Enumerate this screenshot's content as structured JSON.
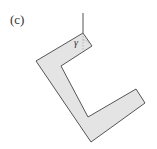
{
  "figure": {
    "panel_label": "(c)",
    "angle_label": "γ",
    "colors": {
      "fill": "#e4e4e4",
      "stroke": "#555555",
      "string": "#555555",
      "text": "#333333"
    }
  }
}
